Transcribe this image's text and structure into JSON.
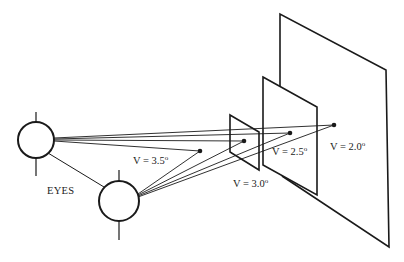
{
  "diagram": {
    "colors": {
      "stroke": "#1a1a1a",
      "background": "#ffffff",
      "text": "#222222"
    },
    "eyes": {
      "label": "EYES",
      "left": {
        "cx": 36,
        "cy": 140,
        "r": 18
      },
      "right": {
        "cx": 119,
        "cy": 201,
        "r": 20
      }
    },
    "targets": [
      {
        "id": "v35",
        "label": "V = 3.5",
        "degree": "o",
        "dot": [
          200,
          151
        ],
        "label_pos": [
          133,
          164
        ]
      },
      {
        "id": "v30",
        "label": "V = 3.0",
        "degree": "o",
        "dot": [
          244,
          141
        ],
        "label_pos": [
          233,
          187
        ]
      },
      {
        "id": "v25",
        "label": "V = 2.5",
        "degree": "o",
        "dot": [
          290,
          133
        ],
        "label_pos": [
          272,
          155
        ]
      },
      {
        "id": "v20",
        "label": "V = 2.0",
        "degree": "o",
        "dot": [
          334,
          125
        ],
        "label_pos": [
          330,
          150
        ]
      }
    ],
    "planes": [
      {
        "id": "small",
        "points": "230,115 259,132 259,170 230,152"
      },
      {
        "id": "medium",
        "points": "263,77 317,107 317,195 263,165"
      },
      {
        "id": "large",
        "points": "280,14 386,70 389,247 282,176"
      }
    ]
  }
}
